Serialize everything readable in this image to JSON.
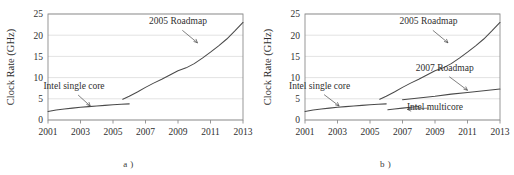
{
  "figure": {
    "panels": [
      {
        "id": "a",
        "caption": "a )",
        "chart_data": {
          "type": "line",
          "title": "",
          "xlabel": "",
          "ylabel": "Clock Rate (GHz)",
          "xlim": [
            2001,
            2013
          ],
          "ylim": [
            0,
            25
          ],
          "xticks": [
            "2001",
            "2003",
            "2005",
            "2007",
            "2009",
            "2011",
            "2013"
          ],
          "yticks": [
            "0",
            "5",
            "10",
            "15",
            "20",
            "25"
          ],
          "grid": "horizontal",
          "legend": "none",
          "annotations": [
            {
              "text": "2005 Roadmap",
              "x": 2009.0,
              "y": 22.6,
              "arrow_to": {
                "x": 2010.2,
                "y": 18.2
              }
            },
            {
              "text": "Intel single core",
              "x": 2002.6,
              "y": 7.4,
              "arrow_to": {
                "x": 2003.6,
                "y": 3.3
              }
            }
          ],
          "series": [
            {
              "name": "Intel single core",
              "x": [
                2001.0,
                2001.5,
                2002.0,
                2002.5,
                2003.0,
                2003.5,
                2004.0,
                2004.5,
                2005.0,
                2005.5,
                2006.0
              ],
              "values": [
                2.0,
                2.35,
                2.6,
                2.8,
                3.0,
                3.15,
                3.3,
                3.45,
                3.6,
                3.7,
                3.8
              ]
            },
            {
              "name": "2005 Roadmap",
              "x": [
                2005.6,
                2006.0,
                2006.5,
                2007.0,
                2007.5,
                2008.0,
                2008.5,
                2009.0,
                2009.5,
                2010.0,
                2010.5,
                2011.0,
                2011.5,
                2012.0,
                2012.5,
                2013.0
              ],
              "values": [
                4.9,
                5.6,
                6.6,
                7.7,
                8.7,
                9.6,
                10.6,
                11.6,
                12.3,
                13.3,
                14.6,
                16.0,
                17.5,
                19.1,
                21.0,
                23.0
              ]
            }
          ]
        }
      },
      {
        "id": "b",
        "caption": "b )",
        "chart_data": {
          "type": "line",
          "title": "",
          "xlabel": "",
          "ylabel": "Clock Rate (GHz)",
          "xlim": [
            2001,
            2013
          ],
          "ylim": [
            0,
            25
          ],
          "xticks": [
            "2001",
            "2003",
            "2005",
            "2007",
            "2009",
            "2011",
            "2013"
          ],
          "yticks": [
            "0",
            "5",
            "10",
            "15",
            "20",
            "25"
          ],
          "grid": "horizontal",
          "legend": "none",
          "annotations": [
            {
              "text": "2005 Roadmap",
              "x": 2008.6,
              "y": 22.6,
              "arrow_to": {
                "x": 2009.8,
                "y": 18.2
              }
            },
            {
              "text": "2007 Roadmap",
              "x": 2009.6,
              "y": 11.6,
              "arrow_to": {
                "x": 2011.0,
                "y": 7.0
              }
            },
            {
              "text": "Intel single core",
              "x": 2001.9,
              "y": 7.4,
              "arrow_to": {
                "x": 2003.1,
                "y": 3.3
              }
            },
            {
              "text": "Intel multicore",
              "x": 2009.0,
              "y": 2.3,
              "arrow_to": {
                "x": 2007.3,
                "y": 2.5
              }
            }
          ],
          "series": [
            {
              "name": "Intel single core",
              "x": [
                2001.0,
                2001.5,
                2002.0,
                2002.5,
                2003.0,
                2003.5,
                2004.0,
                2004.5,
                2005.0,
                2005.5,
                2006.0
              ],
              "values": [
                2.0,
                2.35,
                2.6,
                2.8,
                3.0,
                3.15,
                3.3,
                3.45,
                3.6,
                3.7,
                3.8
              ]
            },
            {
              "name": "2005 Roadmap",
              "x": [
                2005.6,
                2006.0,
                2006.5,
                2007.0,
                2007.5,
                2008.0,
                2008.5,
                2009.0,
                2009.5,
                2010.0,
                2010.5,
                2011.0,
                2011.5,
                2012.0,
                2012.5,
                2013.0
              ],
              "values": [
                4.9,
                5.6,
                6.6,
                7.7,
                8.7,
                9.6,
                10.6,
                11.6,
                12.3,
                13.3,
                14.6,
                16.0,
                17.5,
                19.1,
                21.0,
                23.0
              ]
            },
            {
              "name": "2007 Roadmap",
              "x": [
                2007.0,
                2008.0,
                2009.0,
                2010.0,
                2011.0,
                2012.0,
                2013.0
              ],
              "values": [
                4.8,
                5.2,
                5.6,
                6.1,
                6.5,
                6.9,
                7.3
              ]
            },
            {
              "name": "Intel multicore",
              "x": [
                2006.1,
                2006.5,
                2007.0,
                2007.5,
                2008.0
              ],
              "values": [
                2.4,
                2.6,
                2.8,
                3.0,
                3.2
              ]
            }
          ]
        }
      }
    ]
  },
  "colors": {
    "line": "#4a4a4a",
    "axis": "#8c8c8c",
    "grid": "#d7d7d7",
    "text": "#2f2f2f",
    "background": "#ffffff"
  }
}
